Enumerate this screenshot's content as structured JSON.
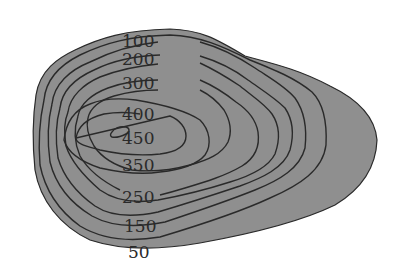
{
  "diagram": {
    "type": "topographic-contour-map",
    "contour_interval": 50,
    "colors": {
      "background": "#ffffff",
      "outline": "#2a2a2a",
      "band_0_50": "#8e8e8e",
      "band_50_100": "#9a9a9a",
      "band_100_150": "#a6a6a6",
      "band_150_200": "#9c9c9c",
      "band_200_250": "#b0b0b0",
      "band_250_300": "#bdbdbd",
      "band_300_350": "#c6c6c6",
      "band_350_400": "#d2d2d2",
      "band_400_450": "#e2e2e2",
      "peak": "#ffffff"
    },
    "labels": [
      {
        "id": "l100",
        "text": "100"
      },
      {
        "id": "l200",
        "text": "200"
      },
      {
        "id": "l300",
        "text": "300"
      },
      {
        "id": "l400",
        "text": "400"
      },
      {
        "id": "l450",
        "text": "450"
      },
      {
        "id": "l350",
        "text": "350"
      },
      {
        "id": "l250",
        "text": "250"
      },
      {
        "id": "l150",
        "text": "150"
      },
      {
        "id": "l50",
        "text": "50"
      }
    ]
  }
}
